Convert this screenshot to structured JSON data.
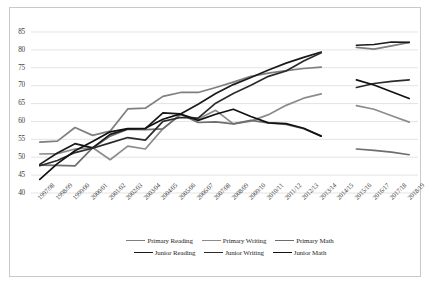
{
  "chart_data": {
    "type": "line",
    "title": "",
    "xlabel": "",
    "ylabel": "",
    "ylim": [
      40,
      85
    ],
    "ytick_step": 5,
    "yticks": [
      40,
      45,
      50,
      55,
      60,
      65,
      70,
      75,
      80,
      85
    ],
    "grid": "horizontal",
    "legend_position": "bottom",
    "gap_note": "No data plotted for 2014/15; all series break between 2013/14 and 2015/16",
    "categories": [
      "1997/98",
      "1998/99",
      "1999/00",
      "2000/01",
      "2001/02",
      "2002/03",
      "2003/04",
      "2004/05",
      "2005/06",
      "2006/07",
      "2007/08",
      "2008/09",
      "2009/10",
      "2010/11",
      "2011/12",
      "2012/13",
      "2013/14",
      "2014/15",
      "2015/16",
      "2016/17",
      "2017/18",
      "2018/19"
    ],
    "series": [
      {
        "name": "Primary Reading",
        "color": "#7f7f7f",
        "values": [
          54.2,
          54.5,
          58.3,
          56.1,
          57.3,
          63.5,
          63.7,
          67.0,
          68.1,
          68.1,
          69.5,
          71.0,
          72.6,
          73.5,
          74.2,
          74.8,
          75.2,
          null,
          80.7,
          80.2,
          81.1,
          82.1
        ]
      },
      {
        "name": "Primary Writing",
        "color": "#8c8c8c",
        "values": [
          50.9,
          51.0,
          52.3,
          52.7,
          49.3,
          53.1,
          52.3,
          58.0,
          61.9,
          60.7,
          63.1,
          59.3,
          60.1,
          61.9,
          64.5,
          66.5,
          67.7,
          null,
          64.4,
          63.4,
          61.6,
          59.8
        ]
      },
      {
        "name": "Primary Math",
        "color": "#6e6e6e",
        "values": [
          47.8,
          47.7,
          47.6,
          52.6,
          55.9,
          57.8,
          57.7,
          57.9,
          62.0,
          59.7,
          59.9,
          59.3,
          60.3,
          59.6,
          59.2,
          58.0,
          55.9,
          null,
          52.3,
          51.9,
          51.4,
          50.7
        ]
      },
      {
        "name": "Junior Reading",
        "color": "#1a1a1a",
        "values": [
          48.0,
          51.2,
          53.8,
          52.6,
          56.4,
          57.9,
          58.0,
          62.4,
          62.1,
          64.8,
          67.8,
          70.3,
          72.3,
          74.4,
          76.3,
          77.9,
          79.4,
          null,
          81.3,
          81.5,
          82.2,
          82.1
        ]
      },
      {
        "name": "Junior Writing",
        "color": "#2b2b2b",
        "values": [
          47.6,
          49.1,
          51.3,
          52.5,
          54.0,
          55.5,
          54.8,
          60.0,
          61.1,
          60.9,
          65.1,
          67.8,
          70.1,
          72.6,
          74.1,
          76.9,
          79.2,
          null,
          69.5,
          70.6,
          71.2,
          71.6
        ]
      },
      {
        "name": "Junior Math",
        "color": "#111111",
        "values": [
          43.8,
          48.2,
          51.8,
          54.4,
          57.1,
          58.0,
          58.1,
          60.6,
          62.1,
          60.3,
          62.0,
          63.4,
          61.4,
          59.6,
          59.4,
          58.1,
          55.9,
          null,
          71.6,
          70.2,
          68.3,
          66.4
        ]
      }
    ]
  },
  "legend": {
    "rows": [
      [
        {
          "label": "Primary Reading",
          "color": "#7f7f7f"
        },
        {
          "label": "Primary Writing",
          "color": "#8c8c8c"
        },
        {
          "label": "Primary Math",
          "color": "#6e6e6e"
        }
      ],
      [
        {
          "label": "Junior Reading",
          "color": "#1a1a1a"
        },
        {
          "label": "Junior Writing",
          "color": "#2b2b2b"
        },
        {
          "label": "Junior Math",
          "color": "#111111"
        }
      ]
    ]
  },
  "style": {
    "grid_color": "#d9d9d9",
    "border_color": "#c9c9c9",
    "tick_text_color": "#3a3a3a",
    "background": "#ffffff"
  }
}
